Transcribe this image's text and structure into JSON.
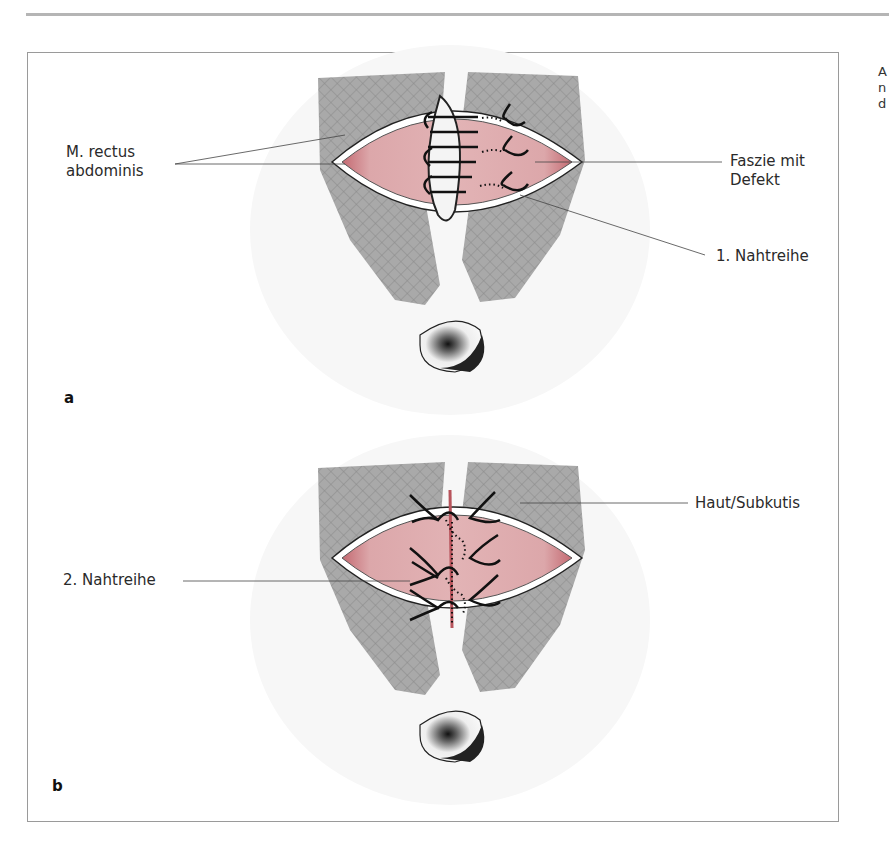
{
  "figure": {
    "panels": [
      {
        "letter": "a",
        "labels": {
          "muscle": "M. rectus\nabdominis",
          "muscle_line1": "M. rectus",
          "muscle_line2": "abdominis",
          "fascia_line1": "Faszie mit",
          "fascia_line2": "Defekt",
          "suture_row": "1. Nahtreihe"
        }
      },
      {
        "letter": "b",
        "labels": {
          "skin": "Haut/Subkutis",
          "suture_row": "2. Nahtreihe"
        }
      }
    ],
    "colors": {
      "muscle_gray": "#a8a8a8",
      "fascia_pink": "#d9a3a6",
      "fascia_edge": "#b8545c",
      "frame": "#9a9a9a"
    }
  },
  "margin_text": [
    "A",
    "n",
    "d"
  ]
}
